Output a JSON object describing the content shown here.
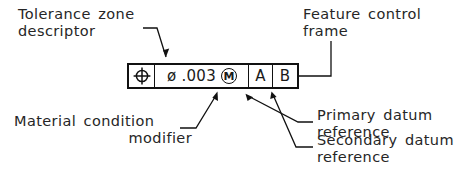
{
  "diagram": {
    "line_color": "#111111",
    "text_color": "#262626",
    "background": "#ffffff"
  },
  "feature_control_frame": {
    "geometric_characteristic_symbol": "position-symbol",
    "tolerance": {
      "diameter_symbol": "ø",
      "value": ".003",
      "material_condition_modifier": "M",
      "modifier_name": "mmc-circled-m"
    },
    "datums": [
      {
        "letter": "A",
        "role": "primary"
      },
      {
        "letter": "B",
        "role": "secondary"
      }
    ]
  },
  "annotations": {
    "tolerance_zone": {
      "line1": "Tolerance  zone",
      "line2": "descriptor"
    },
    "feature_control_frame": {
      "line1": "Feature  control",
      "line2": "frame"
    },
    "material_condition": {
      "line1": "Material  condition",
      "line2": "modifier"
    },
    "primary_datum": {
      "line1": "Primary  datum",
      "line2": "reference"
    },
    "secondary_datum": {
      "line1": "Secondary  datum",
      "line2": "reference"
    }
  }
}
